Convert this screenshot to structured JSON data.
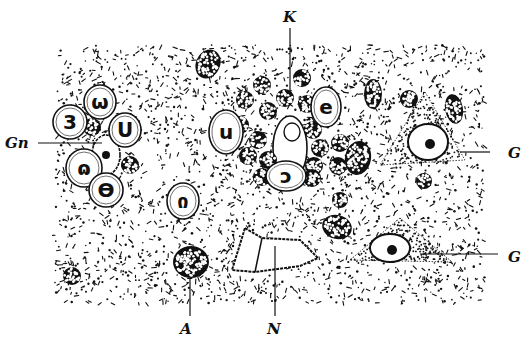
{
  "figure": {
    "colors": {
      "ink": "#111111",
      "paper": "#ffffff"
    },
    "field": {
      "x": 55,
      "y": 45,
      "w": 430,
      "h": 258
    },
    "labels": [
      {
        "id": "K",
        "text": "K",
        "x": 283,
        "y": 22,
        "line": [
          290,
          28,
          290,
          95
        ]
      },
      {
        "id": "Gn",
        "text": "Gn",
        "x": 5,
        "y": 148,
        "line": [
          38,
          143,
          102,
          143
        ]
      },
      {
        "id": "G1",
        "text": "G",
        "x": 508,
        "y": 158,
        "line": [
          460,
          152,
          490,
          152
        ]
      },
      {
        "id": "G2",
        "text": "G",
        "x": 508,
        "y": 262,
        "line": [
          420,
          254,
          498,
          254
        ]
      },
      {
        "id": "A",
        "text": "A",
        "x": 180,
        "y": 334,
        "line": [
          190,
          278,
          190,
          316
        ]
      },
      {
        "id": "N",
        "text": "N",
        "x": 267,
        "y": 334,
        "line": [
          275,
          246,
          275,
          316
        ]
      }
    ],
    "leukocytes": [
      {
        "cx": 100,
        "cy": 102,
        "rx": 16,
        "ry": 17
      },
      {
        "cx": 70,
        "cy": 122,
        "rx": 17,
        "ry": 17
      },
      {
        "cx": 125,
        "cy": 130,
        "rx": 16,
        "ry": 17
      },
      {
        "cx": 84,
        "cy": 168,
        "rx": 18,
        "ry": 19
      },
      {
        "cx": 106,
        "cy": 190,
        "rx": 17,
        "ry": 17
      },
      {
        "cx": 226,
        "cy": 132,
        "rx": 17,
        "ry": 22
      },
      {
        "cx": 326,
        "cy": 107,
        "rx": 15,
        "ry": 20
      },
      {
        "cx": 286,
        "cy": 176,
        "rx": 20,
        "ry": 15
      },
      {
        "cx": 183,
        "cy": 201,
        "rx": 16,
        "ry": 18
      }
    ],
    "lymphocytes": [
      {
        "cx": 92,
        "cy": 127,
        "r": 9
      },
      {
        "cx": 130,
        "cy": 165,
        "r": 9
      },
      {
        "cx": 262,
        "cy": 85,
        "r": 9
      },
      {
        "cx": 302,
        "cy": 78,
        "r": 9
      },
      {
        "cx": 285,
        "cy": 98,
        "r": 9
      },
      {
        "cx": 245,
        "cy": 100,
        "r": 9
      },
      {
        "cx": 268,
        "cy": 111,
        "r": 9
      },
      {
        "cx": 307,
        "cy": 104,
        "r": 9
      },
      {
        "cx": 240,
        "cy": 125,
        "r": 9
      },
      {
        "cx": 258,
        "cy": 140,
        "r": 9
      },
      {
        "cx": 248,
        "cy": 156,
        "r": 9
      },
      {
        "cx": 268,
        "cy": 160,
        "r": 9
      },
      {
        "cx": 313,
        "cy": 130,
        "r": 9
      },
      {
        "cx": 320,
        "cy": 148,
        "r": 9
      },
      {
        "cx": 340,
        "cy": 143,
        "r": 9
      },
      {
        "cx": 314,
        "cy": 166,
        "r": 9
      },
      {
        "cx": 338,
        "cy": 166,
        "r": 9
      },
      {
        "cx": 262,
        "cy": 177,
        "r": 9
      },
      {
        "cx": 312,
        "cy": 178,
        "r": 9
      },
      {
        "cx": 340,
        "cy": 200,
        "r": 8
      },
      {
        "cx": 424,
        "cy": 181,
        "r": 8
      },
      {
        "cx": 409,
        "cy": 99,
        "r": 9
      },
      {
        "cx": 72,
        "cy": 276,
        "r": 9
      }
    ],
    "oval_nuclei": [
      {
        "cx": 208,
        "cy": 64,
        "rx": 12,
        "ry": 15,
        "rot": 25
      },
      {
        "cx": 373,
        "cy": 94,
        "rx": 9,
        "ry": 15,
        "rot": 0
      },
      {
        "cx": 454,
        "cy": 109,
        "rx": 9,
        "ry": 15,
        "rot": -10
      },
      {
        "cx": 337,
        "cy": 227,
        "rx": 15,
        "ry": 12,
        "rot": 15
      },
      {
        "cx": 191,
        "cy": 262,
        "rx": 18,
        "ry": 16,
        "rot": 0
      },
      {
        "cx": 358,
        "cy": 158,
        "rx": 13,
        "ry": 17,
        "rot": 10
      }
    ],
    "capillary": {
      "cx": 290,
      "cy": 148,
      "rx": 17,
      "ry": 32
    },
    "ganglion_cells": [
      {
        "points": "425,92 465,160 380,165",
        "nucleus": {
          "cx": 428,
          "cy": 142,
          "rx": 20,
          "ry": 18
        }
      },
      {
        "points": "400,218 452,262 350,260",
        "nucleus": {
          "cx": 390,
          "cy": 248,
          "rx": 20,
          "ry": 14
        }
      }
    ],
    "nerve_fibre": {
      "points": "245,228 262,238 300,240 318,258 300,266 255,272 232,270"
    },
    "gn_cell": {
      "cx": 106,
      "cy": 155,
      "rx": 14,
      "ry": 20
    }
  }
}
